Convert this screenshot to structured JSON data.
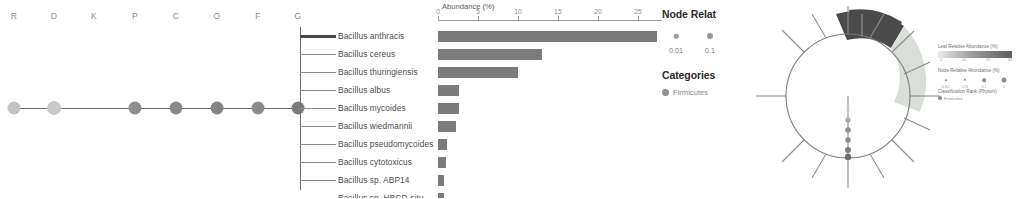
{
  "figure": {
    "panel_a": {
      "rank_header_label": "taxonomic-ranks",
      "ranks": [
        {
          "code": "R",
          "x": 14
        },
        {
          "code": "D",
          "x": 54
        },
        {
          "code": "K",
          "x": 94
        },
        {
          "code": "P",
          "x": 135
        },
        {
          "code": "C",
          "x": 176
        },
        {
          "code": "O",
          "x": 217
        },
        {
          "code": "F",
          "x": 258
        },
        {
          "code": "G",
          "x": 298
        }
      ],
      "nodes": [
        {
          "x": 14,
          "color": "#c4c4c4",
          "size": 13
        },
        {
          "x": 54,
          "color": "#c9c9c9",
          "size": 14
        },
        {
          "x": 135,
          "color": "#8e8e8e",
          "size": 13
        },
        {
          "x": 176,
          "color": "#8a8a8a",
          "size": 13
        },
        {
          "x": 217,
          "color": "#848484",
          "size": 13
        },
        {
          "x": 258,
          "color": "#8b8b8b",
          "size": 13
        },
        {
          "x": 298,
          "color": "#7c7c7c",
          "size": 13
        }
      ]
    },
    "panel_b": {
      "axis": {
        "title": "Abundance (%)",
        "ticks": [
          0,
          5,
          10,
          15,
          20,
          25
        ],
        "min": 0,
        "max": 28,
        "tick_labels": [
          "0",
          "5",
          "10",
          "15",
          "20",
          "25"
        ]
      },
      "bar_color": "#7b7b7b",
      "leaves": [
        {
          "name": "Bacillus anthracis",
          "value": 27.4,
          "highlight": true
        },
        {
          "name": "Bacillus cereus",
          "value": 13.0,
          "highlight": false
        },
        {
          "name": "Bacillus thuringiensis",
          "value": 10.0,
          "highlight": false
        },
        {
          "name": "Bacillus albus",
          "value": 2.6,
          "highlight": false
        },
        {
          "name": "Bacillus mycoides",
          "value": 2.6,
          "highlight": false
        },
        {
          "name": "Bacillus wiedmannii",
          "value": 2.2,
          "highlight": false
        },
        {
          "name": "Bacillus pseudomycoides",
          "value": 1.1,
          "highlight": false
        },
        {
          "name": "Bacillus cytotoxicus",
          "value": 1.0,
          "highlight": false
        },
        {
          "name": "Bacillus sp. ABP14",
          "value": 0.7,
          "highlight": false
        },
        {
          "name": "Bacillus sp. HBCD-sjtu",
          "value": 0.7,
          "highlight": false
        }
      ]
    },
    "panel_c": {
      "node_legend_title": "Node Relat",
      "node_sizes": [
        {
          "label": "0.01",
          "diameter": 4.5
        },
        {
          "label": "0.1",
          "diameter": 6.0
        }
      ],
      "categories_title": "Categories",
      "categories": [
        {
          "label": "Firmicutes",
          "color": "#8f8f8f"
        }
      ]
    },
    "panel_e": {
      "leaf_abundance_title": "Leaf Relative Abundance (%)",
      "leaf_abundance_ticks": [
        "0",
        "10",
        "20",
        "30"
      ],
      "node_abundance_title": "Node Relative Abundance (%)",
      "node_abundance_sizes": [
        {
          "label": "0.001",
          "diameter": 1.6
        },
        {
          "label": "0.01",
          "diameter": 2.4
        },
        {
          "label": "0.1",
          "diameter": 3.6
        },
        {
          "label": "1",
          "diameter": 5.0
        }
      ],
      "rank_title": "Classification Rank (Phylum)",
      "rank_items": [
        {
          "label": "Firmicutes",
          "color": "#8f8f8f"
        }
      ]
    },
    "panel_d": {
      "arc_outer_labels": [
        "Actinobacteria",
        "Proteobacteria"
      ],
      "arcs": [
        {
          "name": "dark-arc",
          "color": "#4a4a4a"
        },
        {
          "name": "light-arc",
          "color": "#d8ded8"
        }
      ]
    }
  }
}
